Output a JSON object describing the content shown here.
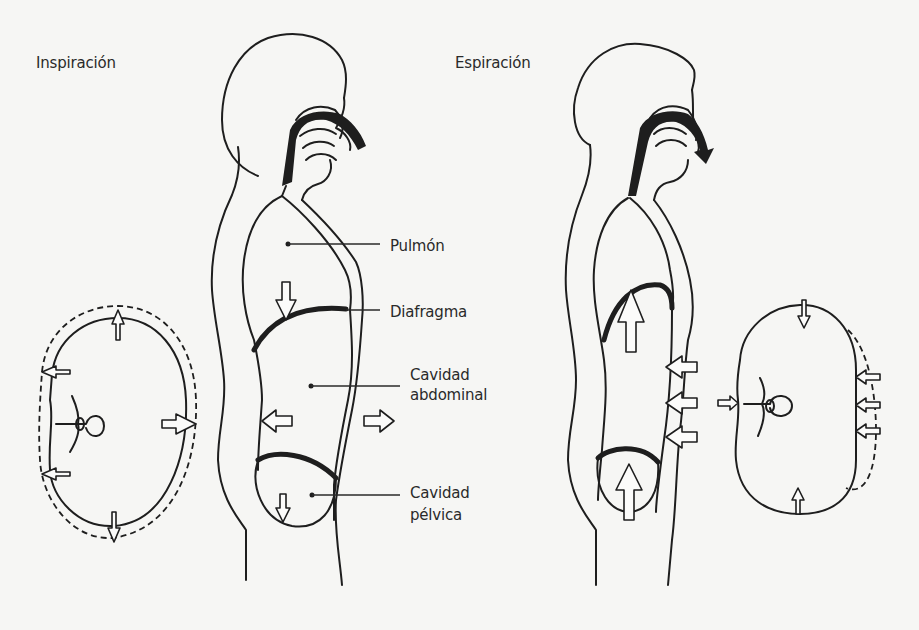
{
  "figure": {
    "inspiration": {
      "title": "Inspiración",
      "labels": {
        "lung": "Pulmón",
        "diaphragm": "Diafragma",
        "abdominal_line1": "Cavidad",
        "abdominal_line2": "abdominal",
        "pelvic_line1": "Cavidad",
        "pelvic_line2": "pélvica"
      }
    },
    "expiration": {
      "title": "Espiración"
    },
    "colors": {
      "ink": "#1e1e1e",
      "paper": "#f6f6f4",
      "arrow_fill": "#fbfbfa"
    }
  }
}
